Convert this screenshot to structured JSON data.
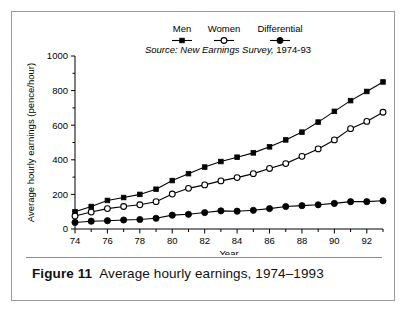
{
  "figure": {
    "caption_label": "Figure 11",
    "caption_text": "Average hourly earnings, 1974–1993"
  },
  "chart_data": {
    "type": "line",
    "title": "",
    "xlabel": "Year",
    "ylabel": "Average hourly earnings (pence/hour)",
    "source_note": "Source: New Earnings Survey,",
    "source_years": " 1974-93",
    "xlim": [
      1974,
      1993
    ],
    "ylim": [
      0,
      1000
    ],
    "yticks": [
      0,
      200,
      400,
      600,
      800,
      1000
    ],
    "ytick_labels": [
      "0",
      "200",
      "400",
      "600",
      "800",
      "1000"
    ],
    "xticks": [
      1974,
      1976,
      1978,
      1980,
      1982,
      1984,
      1986,
      1988,
      1990,
      1992
    ],
    "xtick_labels": [
      "74",
      "76",
      "78",
      "80",
      "82",
      "84",
      "86",
      "88",
      "90",
      "92"
    ],
    "xminor": [
      1975,
      1977,
      1979,
      1981,
      1983,
      1985,
      1987,
      1989,
      1991,
      1993
    ],
    "grid": false,
    "legend_position": "top-center",
    "x": [
      1974,
      1975,
      1976,
      1977,
      1978,
      1979,
      1980,
      1981,
      1982,
      1983,
      1984,
      1985,
      1986,
      1987,
      1988,
      1989,
      1990,
      1991,
      1992,
      1993
    ],
    "series": [
      {
        "name": "Men",
        "marker": "filled-square",
        "values": [
          100,
          130,
          165,
          182,
          200,
          230,
          280,
          320,
          358,
          390,
          415,
          440,
          475,
          515,
          560,
          618,
          680,
          742,
          795,
          850
        ]
      },
      {
        "name": "Women",
        "marker": "open-circle",
        "values": [
          75,
          98,
          118,
          130,
          140,
          158,
          202,
          235,
          255,
          278,
          297,
          320,
          350,
          378,
          420,
          463,
          515,
          580,
          622,
          675
        ]
      },
      {
        "name": "Differential",
        "marker": "filled-circle",
        "values": [
          38,
          45,
          48,
          52,
          55,
          62,
          80,
          85,
          95,
          105,
          103,
          108,
          118,
          130,
          135,
          140,
          148,
          158,
          158,
          163
        ]
      }
    ]
  }
}
